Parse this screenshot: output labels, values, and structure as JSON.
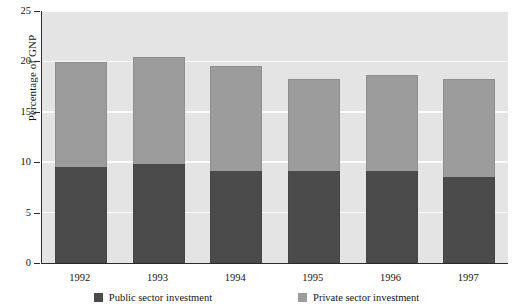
{
  "chart_data": {
    "type": "bar",
    "stacked": true,
    "title": "",
    "xlabel": "",
    "ylabel": "Percentage of GNP",
    "categories": [
      "1992",
      "1993",
      "1994",
      "1995",
      "1996",
      "1997"
    ],
    "series": [
      {
        "name": "Public sector investment",
        "color": "#4b4b4b",
        "values": [
          9.5,
          9.8,
          9.1,
          9.1,
          9.1,
          8.5
        ]
      },
      {
        "name": "Private sector investment",
        "color": "#9c9c9c",
        "values": [
          10.4,
          10.6,
          10.4,
          9.2,
          9.6,
          9.8
        ]
      }
    ],
    "totals": [
      19.9,
      20.4,
      19.5,
      18.3,
      18.7,
      18.3
    ],
    "ylim": [
      0,
      25
    ],
    "yticks": [
      0,
      5,
      10,
      15,
      20,
      25
    ],
    "ytick_labels": [
      "0",
      "5",
      "10",
      "15",
      "20",
      "25"
    ],
    "grid": true,
    "grid_color": "#fbfbfb",
    "plot_background": "#e4e4e4",
    "axis_color": "#2b2b2b",
    "legend_position": "bottom"
  },
  "legend": {
    "items": [
      {
        "label": "Public sector investment",
        "swatch": "public-swatch"
      },
      {
        "label": "Private sector investment",
        "swatch": "private-swatch"
      }
    ]
  }
}
